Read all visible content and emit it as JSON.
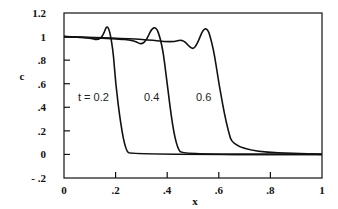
{
  "chart_data": {
    "type": "line",
    "title": "",
    "xlabel": "x",
    "ylabel": "c",
    "xlim": [
      0,
      1
    ],
    "ylim": [
      -0.2,
      1.2
    ],
    "grid": false,
    "x_ticks": [
      "0",
      ".2",
      ".4",
      ".6",
      ".8",
      "1"
    ],
    "y_ticks": [
      "1.2",
      "1",
      ".8",
      ".6",
      ".4",
      ".2",
      "0",
      "- .2"
    ],
    "annotations": [
      "t = 0.2",
      "0.4",
      "0.6"
    ],
    "series": [
      {
        "name": "t = 0.2",
        "x": [
          0,
          0.1,
          0.13,
          0.15,
          0.17,
          0.19,
          0.2,
          0.22,
          0.24,
          0.26,
          1
        ],
        "y": [
          1.0,
          0.99,
          0.97,
          1.0,
          1.12,
          0.9,
          0.6,
          0.25,
          0.03,
          0.0,
          0.0
        ]
      },
      {
        "name": "t = 0.4",
        "x": [
          0,
          0.2,
          0.27,
          0.31,
          0.35,
          0.38,
          0.4,
          0.42,
          0.44,
          0.46,
          1
        ],
        "y": [
          1.0,
          0.98,
          0.97,
          0.92,
          1.12,
          0.95,
          0.6,
          0.25,
          0.05,
          0.0,
          0.0
        ]
      },
      {
        "name": "t = 0.6",
        "x": [
          0,
          0.3,
          0.42,
          0.46,
          0.49,
          0.51,
          0.55,
          0.58,
          0.6,
          0.63,
          0.66,
          1
        ],
        "y": [
          1.0,
          0.98,
          0.95,
          0.98,
          0.9,
          0.9,
          1.12,
          0.9,
          0.6,
          0.25,
          0.03,
          0.0
        ]
      }
    ]
  }
}
